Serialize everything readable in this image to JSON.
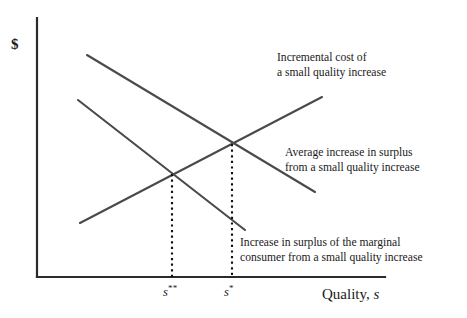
{
  "figure": {
    "type": "economics-line-diagram",
    "background_color": "#ffffff",
    "line_color": "#4a4a4a",
    "axis_color": "#2b2b2b",
    "dotted_color": "#111111"
  },
  "axes": {
    "y_label": "$",
    "x_title_text": "Quality,",
    "x_title_variable": "s",
    "origin": [
      37,
      277
    ],
    "y_top": [
      37,
      18
    ],
    "x_right": [
      385,
      277
    ]
  },
  "ticks": [
    {
      "name": "s-double-star",
      "base": "s",
      "superscript": "**",
      "x": 172
    },
    {
      "name": "s-single-star",
      "base": "s",
      "superscript": "*",
      "x": 232
    }
  ],
  "curves": [
    {
      "name": "incremental-cost",
      "direction": "upward",
      "from": [
        80,
        223
      ],
      "to": [
        322,
        97
      ]
    },
    {
      "name": "average-increase-in-surplus",
      "direction": "downward",
      "from": [
        87,
        55
      ],
      "to": [
        315,
        192
      ]
    },
    {
      "name": "marginal-consumer-surplus",
      "direction": "downward",
      "from": [
        78,
        100
      ],
      "to": [
        245,
        230
      ]
    }
  ],
  "intersections": [
    {
      "name": "s-double-star-intersection",
      "point": [
        172,
        174
      ],
      "drop_to_y": 277
    },
    {
      "name": "s-single-star-intersection",
      "point": [
        232,
        144
      ],
      "drop_to_y": 277
    }
  ],
  "annotations": {
    "incremental_cost": {
      "line1": "Incremental cost of",
      "line2": "a small quality increase"
    },
    "average_surplus": {
      "line1": "Average increase in surplus",
      "line2": "from a small quality increase"
    },
    "marginal_consumer": {
      "line1": "Increase in surplus of the marginal",
      "line2": "consumer from a small quality increase"
    }
  },
  "chart_data": {
    "type": "line",
    "title": "",
    "xlabel": "Quality, s",
    "ylabel": "$",
    "grid": false,
    "legend_position": "inline-annotations",
    "xtick_labels": [
      "s**",
      "s*"
    ],
    "xtick_positions": [
      172,
      232
    ],
    "series": [
      {
        "name": "Incremental cost of a small quality increase",
        "slope": "positive",
        "points": [
          [
            80,
            223
          ],
          [
            322,
            97
          ]
        ]
      },
      {
        "name": "Average increase in surplus from a small quality increase",
        "slope": "negative",
        "points": [
          [
            87,
            55
          ],
          [
            315,
            192
          ]
        ]
      },
      {
        "name": "Increase in surplus of the marginal consumer from a small quality increase",
        "slope": "negative",
        "points": [
          [
            78,
            100
          ],
          [
            245,
            230
          ]
        ]
      }
    ],
    "annotations": [
      "Incremental cost of a small quality increase",
      "Average increase in surplus from a small quality increase",
      "Increase in surplus of the marginal consumer from a small quality increase"
    ]
  }
}
